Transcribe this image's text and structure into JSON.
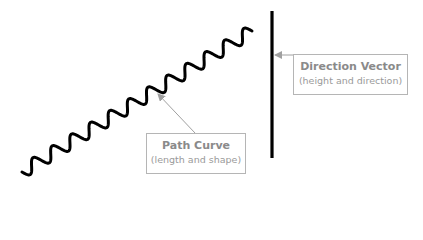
{
  "diagram": {
    "labels": {
      "direction_vector": {
        "title": "Direction Vector",
        "subtitle": "(height and direction)"
      },
      "path_curve": {
        "title": "Path Curve",
        "subtitle": "(length and shape)"
      }
    },
    "colors": {
      "stroke": "#000000",
      "annotation": "#a0a0a0",
      "label_text": "#8a8a8a"
    },
    "elements": {
      "wavy_curve": {
        "start": [
          22,
          172
        ],
        "end": [
          252,
          31
        ],
        "wave_count": 12
      },
      "vertical_line": {
        "x": 272,
        "y1": 11,
        "y2": 158
      }
    }
  }
}
